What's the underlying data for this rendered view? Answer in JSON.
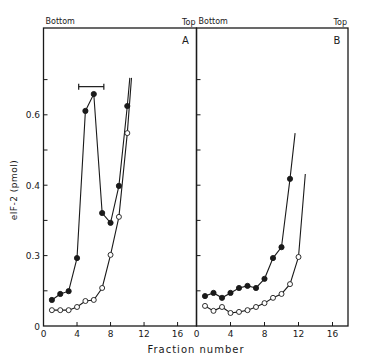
{
  "chart_data": {
    "type": "line",
    "ylabel": "eIF-2 (pmol)",
    "xlabel": "Fraction number",
    "y_tick_labels": [
      {
        "label": "0",
        "tick_index": 0
      },
      {
        "label": "0.3",
        "tick_index": 2
      },
      {
        "label": "0.4",
        "tick_index": 4
      },
      {
        "label": "0.6",
        "tick_index": 6
      }
    ],
    "y_tick_count": 7,
    "y_tick_step_value": 0.1,
    "x_ticks": [
      "0",
      "4",
      "8",
      "12",
      "16"
    ],
    "xlim": [
      0,
      18.3
    ],
    "panels": [
      {
        "id": "A",
        "label": "A",
        "top_left_label": "Bottom",
        "top_right_label": "Top",
        "bracket": {
          "x_start": 4.2,
          "x_end": 7.2,
          "y": 0.68
        },
        "series": [
          {
            "name": "filled circles",
            "marker": "filled",
            "x": [
              1,
              2,
              3,
              4,
              5,
              6,
              7,
              8,
              9,
              10
            ],
            "y": [
              0.074,
              0.091,
              0.099,
              0.193,
              0.611,
              0.659,
              0.321,
              0.293,
              0.398,
              0.625
            ],
            "line_extends_to": {
              "x": 10.3,
              "y": 0.705
            }
          },
          {
            "name": "open circles",
            "marker": "open",
            "x": [
              1,
              2,
              3,
              4,
              5,
              6,
              7,
              8,
              9,
              10
            ],
            "y": [
              0.045,
              0.045,
              0.045,
              0.054,
              0.071,
              0.074,
              0.108,
              0.202,
              0.31,
              0.548
            ],
            "line_extends_to": {
              "x": 10.5,
              "y": 0.705
            }
          }
        ]
      },
      {
        "id": "B",
        "label": "B",
        "top_left_label": "Bottom",
        "top_right_label": "Top",
        "series": [
          {
            "name": "filled circles",
            "marker": "filled",
            "x": [
              1,
              2,
              3,
              4,
              5,
              6,
              7,
              8,
              9,
              10,
              11
            ],
            "y": [
              0.085,
              0.094,
              0.08,
              0.094,
              0.108,
              0.114,
              0.108,
              0.134,
              0.193,
              0.224,
              0.418
            ],
            "line_extends_to": {
              "x": 11.6,
              "y": 0.548
            }
          },
          {
            "name": "open circles",
            "marker": "open",
            "x": [
              1,
              2,
              3,
              4,
              5,
              6,
              7,
              8,
              9,
              10,
              11,
              12
            ],
            "y": [
              0.057,
              0.043,
              0.054,
              0.037,
              0.04,
              0.045,
              0.054,
              0.065,
              0.08,
              0.091,
              0.119,
              0.196
            ],
            "line_extends_to": {
              "x": 12.8,
              "y": 0.432
            }
          }
        ]
      }
    ]
  }
}
